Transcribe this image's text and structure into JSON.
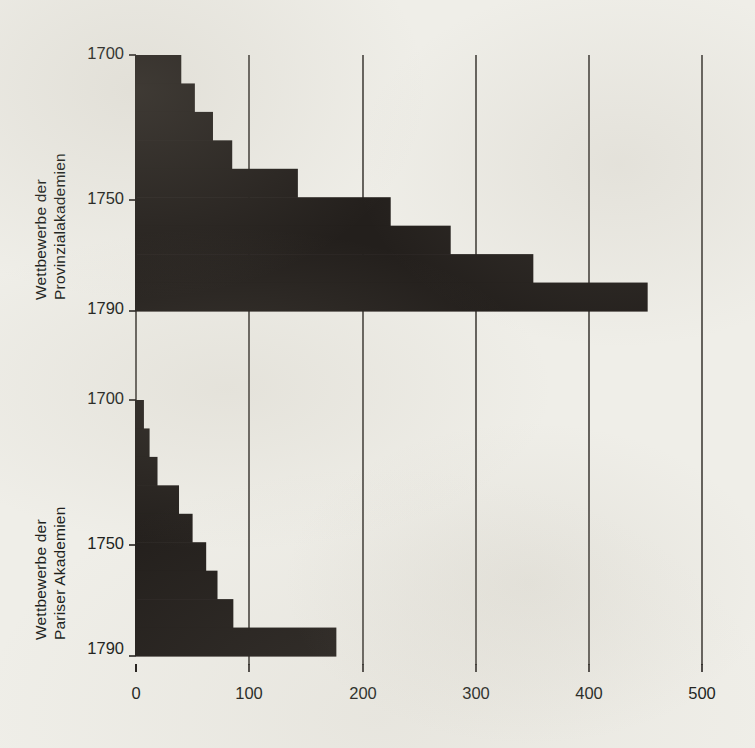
{
  "figure": {
    "background_color": "#efeee8",
    "ink_color": "#231f1c",
    "bar_color": "#231f1c"
  },
  "panels": {
    "top": {
      "axis_title_line1": "Wettbewerbe der",
      "axis_title_line2": "Provinzialakademien",
      "ytick_top": "1700",
      "ytick_mid": "1750",
      "ytick_bottom": "1790"
    },
    "bottom": {
      "axis_title_line1": "Wettbewerbe der",
      "axis_title_line2": "Pariser Akademien",
      "ytick_top": "1700",
      "ytick_mid": "1750",
      "ytick_bottom": "1790"
    }
  },
  "xaxis": {
    "ticks": [
      "0",
      "100",
      "200",
      "300",
      "400",
      "500"
    ]
  },
  "chart_data": [
    {
      "type": "bar",
      "orientation": "horizontal",
      "title": "Wettbewerbe der Provinzialakademien",
      "xlabel": "",
      "ylabel": "Wettbewerbe der Provinzialakademien",
      "xlim": [
        0,
        500
      ],
      "ylim": [
        1700,
        1790
      ],
      "grid": true,
      "grid_axis": "x",
      "legend": null,
      "categories": [
        "1700-1710",
        "1710-1720",
        "1720-1730",
        "1730-1740",
        "1740-1750",
        "1750-1760",
        "1760-1770",
        "1770-1780",
        "1780-1790"
      ],
      "tick_labels_y": [
        "1700",
        "1750",
        "1790"
      ],
      "tick_labels_x": [
        "0",
        "100",
        "200",
        "300",
        "400",
        "500"
      ],
      "values": [
        40,
        52,
        68,
        85,
        143,
        225,
        278,
        351,
        452
      ]
    },
    {
      "type": "bar",
      "orientation": "horizontal",
      "title": "Wettbewerbe der Pariser Akademien",
      "xlabel": "",
      "ylabel": "Wettbewerbe der Pariser Akademien",
      "xlim": [
        0,
        500
      ],
      "ylim": [
        1700,
        1790
      ],
      "grid": true,
      "grid_axis": "x",
      "legend": null,
      "categories": [
        "1700-1710",
        "1710-1720",
        "1720-1730",
        "1730-1740",
        "1740-1750",
        "1750-1760",
        "1760-1770",
        "1770-1780",
        "1780-1790"
      ],
      "tick_labels_y": [
        "1700",
        "1750",
        "1790"
      ],
      "tick_labels_x": [
        "0",
        "100",
        "200",
        "300",
        "400",
        "500"
      ],
      "values": [
        7,
        12,
        19,
        38,
        50,
        62,
        72,
        86,
        177
      ]
    }
  ]
}
